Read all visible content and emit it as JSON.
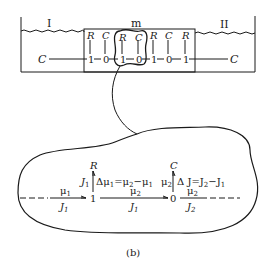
{
  "figure": {
    "caption": "(b)",
    "ink_color": "#1a1a1a",
    "background_color": "#ffffff"
  },
  "top": {
    "compartment_left_label": "I",
    "membrane_label": "m",
    "compartment_right_label": "II",
    "left_reservoir": "C",
    "right_reservoir": "C",
    "chain": [
      {
        "top": "R",
        "node": "1"
      },
      {
        "top": "C",
        "node": "0"
      },
      {
        "top": "R",
        "node": "1"
      },
      {
        "top": "C",
        "node": "0"
      },
      {
        "top": "R",
        "node": "1"
      },
      {
        "top": "C",
        "node": "0"
      },
      {
        "top": "R",
        "node": "1"
      }
    ]
  },
  "detail": {
    "junction1": {
      "node": "1",
      "element": "R",
      "left_flow": "J",
      "left_flow_sub": "1",
      "right_label": "Δμ",
      "right_label_sub": "1",
      "eq": "=μ",
      "eq_sub2": "2",
      "minus": "−μ",
      "minus_sub": "1"
    },
    "junction0": {
      "node": "0",
      "element": "C",
      "left_effort": "μ",
      "left_effort_sub": "2",
      "right_label": "Δ J=J",
      "right_label_sub": "2",
      "minus": "−J",
      "minus_sub": "1"
    },
    "bond_in": {
      "effort": "μ",
      "effort_sub": "1",
      "flow": "J",
      "flow_sub": "1"
    },
    "bond_mid": {
      "effort": "μ",
      "effort_sub": "2",
      "flow": "J",
      "flow_sub": "1"
    },
    "bond_out": {
      "effort": "μ",
      "effort_sub": "2",
      "flow": "J",
      "flow_sub": "2"
    }
  }
}
